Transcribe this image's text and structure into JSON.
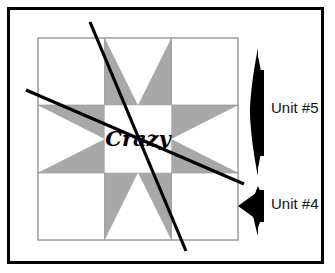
{
  "figure": {
    "title_text": "Crazy",
    "frame": {
      "outer_border_color": "#000000",
      "background_color": "#ffffff"
    },
    "block": {
      "name": "variable-star-quilt-block",
      "grid": "3x3",
      "star_point_color": "#a8a8a8",
      "background_color": "#ffffff",
      "seam_line_color": "#a0a0a0",
      "center_label": "Crazy",
      "corner_squares": [
        "top-left",
        "top-right",
        "bottom-left",
        "bottom-right"
      ],
      "star_point_units": [
        "top",
        "left",
        "right",
        "bottom"
      ]
    },
    "guide_lines": {
      "color": "#000000",
      "count": 2,
      "description": "diagonal cutting lines"
    },
    "annotations": [
      {
        "id": "unit-5",
        "label": "Unit #5",
        "marker": "bracket-arrow-left",
        "marker_color": "#000000"
      },
      {
        "id": "unit-4",
        "label": "Unit #4",
        "marker": "arrow-left",
        "marker_color": "#000000"
      }
    ]
  }
}
